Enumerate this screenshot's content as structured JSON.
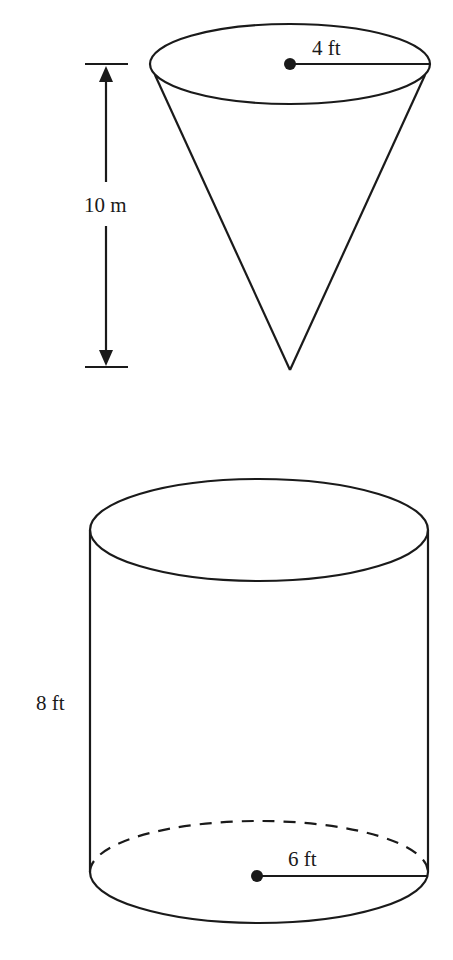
{
  "figures": {
    "cone": {
      "shape": "cone (inverted, point down)",
      "radius_label": "4 ft",
      "height_label": "10 m",
      "height_indicator": "double-headed arrow with end ticks, left of cone"
    },
    "cylinder": {
      "shape": "right circular cylinder",
      "radius_label": "6 ft",
      "height_label": "8 ft",
      "bottom_back_edge": "dashed"
    }
  },
  "colors": {
    "ink": "#1a1a1a",
    "background": "#ffffff"
  }
}
